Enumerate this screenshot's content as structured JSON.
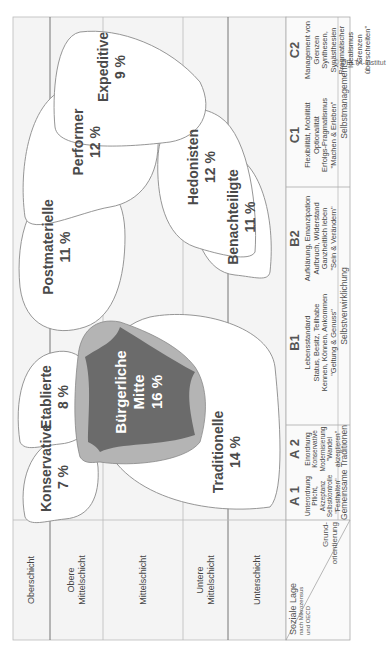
{
  "copyright": "© DELTA-Institut",
  "row_labels": [
    {
      "label": "Oberschicht"
    },
    {
      "label": "Obere Mittelschicht"
    },
    {
      "label": "Mittelschicht"
    },
    {
      "label": "Untere Mittelschicht"
    },
    {
      "label": "Unterschicht"
    }
  ],
  "corner": {
    "top_title": "Soziale Lage",
    "top_sub": "nach Mikrozensus und OECD",
    "bottom_title": "Grund-orientierung"
  },
  "columns": [
    {
      "code": "A 1",
      "lines": [
        "Unterordnung",
        "Pflicht, Akzeptanz",
        "Selbstkontrolle",
        "\"Festhalten\""
      ]
    },
    {
      "code": "A 2",
      "lines": [
        "Einordnung",
        "Konservative",
        "Modernisierung",
        "\"Wandel akzeptieren\""
      ]
    },
    {
      "code": "B1",
      "lines": [
        "Lebensstandard",
        "Status, Besitz, Teilhabe",
        "Kennen, Können, Ankommen",
        "\"Geltung & Genuss\""
      ]
    },
    {
      "code": "B2",
      "lines": [
        "Aufklärung, Emanzipation",
        "Aufbruch, Widerstand",
        "Ganzheitlich leben",
        "\"Sein & Verändern\""
      ]
    },
    {
      "code": "C1",
      "lines": [
        "Flexibilität, Mobilität",
        "Optionalität",
        "Erfolgs-Pragmatismus",
        "\"Machen & Erleben\""
      ]
    },
    {
      "code": "C2",
      "lines": [
        "Management von Grenzen",
        "Synthesen, Synästhesien",
        "Pragmatischer Idealismus",
        "\"Grenzen überschreiten\""
      ]
    }
  ],
  "groups": [
    {
      "label": "Gemeinsame Traditionen"
    },
    {
      "label": "Selbstverwirklichung"
    },
    {
      "label": "Selbstmanagement"
    }
  ],
  "milieus": [
    {
      "name": "Konservative",
      "percent": "7 %"
    },
    {
      "name": "Etablierte",
      "percent": "8 %"
    },
    {
      "name": "Traditionelle",
      "percent": "14 %"
    },
    {
      "name": "Bürgerliche Mitte",
      "name_line1": "Bürgerliche",
      "name_line2": "Mitte",
      "percent": "16 %"
    },
    {
      "name": "Postmaterielle",
      "percent": "11 %"
    },
    {
      "name": "Benachteiligte",
      "percent": "11 %"
    },
    {
      "name": "Performer",
      "percent": "12 %"
    },
    {
      "name": "Hedonisten",
      "percent": "12 %"
    },
    {
      "name": "Expeditive",
      "percent": "9 %"
    }
  ],
  "colors": {
    "grid_bg": "#f4f4f4",
    "line": "#777777",
    "mitte_dark": "#6b6b6b",
    "mitte_light": "#b4b4b4",
    "blob_stroke": "#8a8a8a"
  }
}
